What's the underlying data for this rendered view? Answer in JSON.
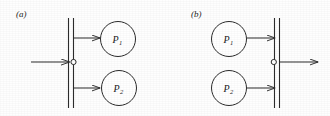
{
  "figure": {
    "width": 330,
    "height": 116,
    "background_color": "#fefefe",
    "ink_color": "#2b2b2b",
    "panels": [
      {
        "id": "a",
        "label": "(a)",
        "label_x": 16,
        "label_y": 17,
        "description": "single input arrow enters a node on a vertical double bar, which fans out to two process circles P1 and P2 on the right",
        "bar": {
          "name": "synchronization-bar",
          "x1": 68,
          "x2": 73,
          "y_top": 18,
          "y_bottom": 108
        },
        "node": {
          "name": "junction-node",
          "cx": 73.5,
          "cy": 62,
          "r": 2.6
        },
        "arrows": [
          {
            "name": "input-arrow",
            "x1": 31,
            "y1": 62,
            "x2": 70,
            "y2": 62,
            "direction": "right"
          },
          {
            "name": "arrow-to-p1",
            "x1": 73.5,
            "y1": 38,
            "x2": 100,
            "y2": 38,
            "direction": "right"
          },
          {
            "name": "arrow-to-p2",
            "x1": 73.5,
            "y1": 88,
            "x2": 100,
            "y2": 88,
            "direction": "right"
          }
        ],
        "processes": [
          {
            "name": "process-p1",
            "label": "P",
            "subscript": "1",
            "cx": 118,
            "cy": 39,
            "r": 17.5
          },
          {
            "name": "process-p2",
            "label": "P",
            "subscript": "2",
            "cx": 119,
            "cy": 88,
            "r": 17.5
          }
        ]
      },
      {
        "id": "b",
        "label": "(b)",
        "label_x": 191,
        "label_y": 17,
        "description": "two process circles P1 and P2 on the left feed arrows into a vertical double bar, whose node emits a single output arrow to the right",
        "bar": {
          "name": "synchronization-bar",
          "x1": 274,
          "x2": 279,
          "y_top": 18,
          "y_bottom": 108
        },
        "node": {
          "name": "junction-node",
          "cx": 273.5,
          "cy": 62,
          "r": 2.6
        },
        "arrows": [
          {
            "name": "arrow-from-p1",
            "x1": 247,
            "y1": 38,
            "x2": 274,
            "y2": 38,
            "direction": "right"
          },
          {
            "name": "arrow-from-p2",
            "x1": 247,
            "y1": 88,
            "x2": 274,
            "y2": 88,
            "direction": "right"
          },
          {
            "name": "output-arrow",
            "x1": 279,
            "y1": 62,
            "x2": 318,
            "y2": 62,
            "direction": "right"
          }
        ],
        "processes": [
          {
            "name": "process-p1",
            "label": "P",
            "subscript": "1",
            "cx": 229,
            "cy": 39,
            "r": 17.5
          },
          {
            "name": "process-p2",
            "label": "P",
            "subscript": "2",
            "cx": 229,
            "cy": 88,
            "r": 17.5
          }
        ]
      }
    ]
  }
}
